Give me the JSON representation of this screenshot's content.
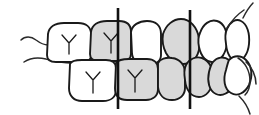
{
  "figure": {
    "background_color": "#ffffff",
    "width": 259,
    "height": 115,
    "stroke_color": "#1a1a1a",
    "shade_color": "#d9d9d9",
    "reference_line_color": "#111111"
  },
  "reference_lines": [
    {
      "name": "posterior-reference-line",
      "x": 118,
      "y_top": 8,
      "y_bottom": 109,
      "label": ""
    },
    {
      "name": "anterior-reference-line",
      "x": 190,
      "y_top": 10,
      "y_bottom": 109,
      "label": ""
    }
  ],
  "arches": {
    "upper": {
      "name": "upper-arch",
      "teeth": [
        {
          "name": "upper-molar-1",
          "shaded": false,
          "cusp_mark": true
        },
        {
          "name": "upper-molar-2",
          "shaded": true,
          "cusp_mark": true
        },
        {
          "name": "upper-premolar",
          "shaded": false,
          "cusp_mark": false
        },
        {
          "name": "upper-canine",
          "shaded": true,
          "cusp_mark": false
        },
        {
          "name": "upper-lateral-incisor",
          "shaded": false,
          "cusp_mark": false
        },
        {
          "name": "upper-central-incisor",
          "shaded": false,
          "cusp_mark": false
        }
      ]
    },
    "lower": {
      "name": "lower-arch",
      "teeth": [
        {
          "name": "lower-molar-1",
          "shaded": false,
          "cusp_mark": true
        },
        {
          "name": "lower-molar-2",
          "shaded": true,
          "cusp_mark": true
        },
        {
          "name": "lower-premolar",
          "shaded": true,
          "cusp_mark": true
        },
        {
          "name": "lower-canine",
          "shaded": true,
          "cusp_mark": false
        },
        {
          "name": "lower-lateral-incisor",
          "shaded": true,
          "cusp_mark": false
        },
        {
          "name": "lower-central-incisor",
          "shaded": false,
          "cusp_mark": false
        }
      ]
    }
  },
  "contours": [
    {
      "name": "posterior-gingival-contour-upper"
    },
    {
      "name": "posterior-gingival-contour-lower"
    },
    {
      "name": "anterior-lip-contour-upper"
    },
    {
      "name": "anterior-chin-contour-lower"
    }
  ]
}
